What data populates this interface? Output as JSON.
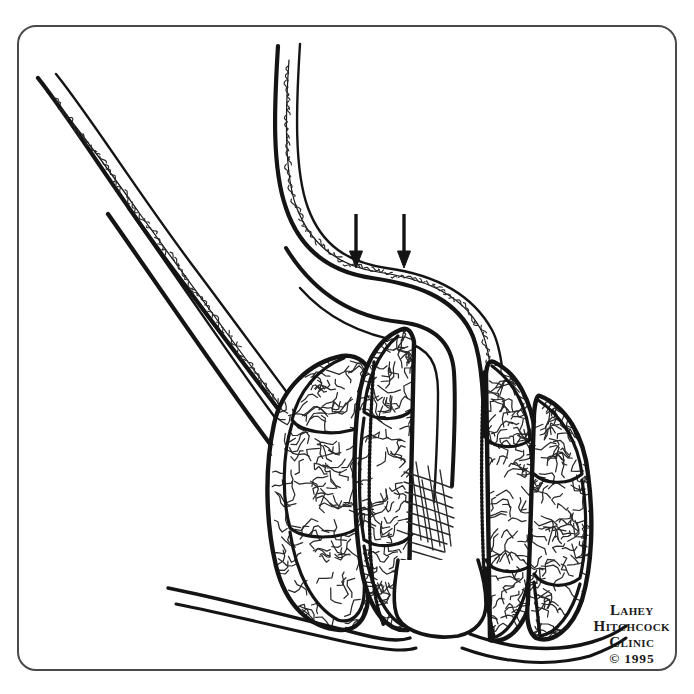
{
  "figure": {
    "kind": "medical-line-illustration",
    "view": "cross-sectional line drawing, black ink on white",
    "canvas": {
      "width": 694,
      "height": 694,
      "background": "#ffffff"
    },
    "ink_color": "#141414",
    "texture_color": "#2a2a2a"
  },
  "frame": {
    "name": "illustration-border",
    "x": 18,
    "y": 26,
    "width": 658,
    "height": 644,
    "radius": 18,
    "stroke": "#4a4a4a",
    "stroke_width": 2
  },
  "annotations": {
    "arrows": [
      {
        "label": "pressure-arrow-left",
        "x": 356,
        "y_start": 214,
        "y_end": 268,
        "head_width": 13,
        "head_length": 17,
        "shaft_width": 3.4
      },
      {
        "label": "pressure-arrow-right",
        "x": 404,
        "y_start": 214,
        "y_end": 268,
        "head_width": 13,
        "head_length": 17,
        "shaft_width": 3.4
      }
    ]
  },
  "anatomy": {
    "upper_left_tube": {
      "name": "sigmoid-limb-outer-wall",
      "outer": "M38,78 C70,118 118,196 172,268 C214,324 262,388 300,438",
      "inner": "M56,74 C90,116 140,196 196,270 C238,326 286,392 324,442",
      "mucosa": "M47,92 C74,122 106,166 140,214 C176,264 214,316 248,362 C272,394 296,428 312,450"
    },
    "lower_left_tube": {
      "name": "rectal-limb-lower-wall",
      "outer": "M108,214 C146,268 196,342 248,414 C280,458 316,506 344,544",
      "inner": "M128,208 C166,262 216,336 268,408 C300,452 336,500 364,538"
    },
    "descending_tube": {
      "name": "rectal-ampulla-anterior-wall",
      "outer": "M278,46 C274,110 272,168 286,208 C300,250 330,272 372,278 C414,284 452,296 470,330 C482,352 484,396 484,436",
      "inner": "M300,44 C296,108 294,170 308,208 C322,246 348,262 386,268 C430,274 470,290 492,330 C504,352 506,400 506,440",
      "mucosa": "M289,60 C285,116 284,172 296,206 C310,244 338,266 378,272 C420,278 460,292 480,328 C492,350 494,398 494,438"
    },
    "posterior_wall": {
      "name": "anal-canal-posterior-wall",
      "outer": "M286,248 C318,300 362,318 400,322 C436,326 452,344 454,372 C456,404 454,448 452,486",
      "inner": "M300,288 C330,322 368,336 404,342 C430,348 438,364 438,392 C438,424 436,466 434,502"
    },
    "lobes_left_outer": {
      "name": "external-hemorrhoidal-lobe-column-left",
      "outline": "M342,356 C310,362 282,388 274,424 C264,470 266,524 276,566 C286,606 310,628 340,630 C356,631 366,620 368,600 L372,380 C370,364 358,354 342,356 Z",
      "segments": [
        "M344,358 C318,368 298,392 292,420 C300,432 330,436 352,430 C364,426 370,414 370,398",
        "M292,424 C282,456 282,498 290,528 C304,540 340,540 358,528 C366,518 368,496 368,470",
        "M290,532 C296,572 312,606 338,620 C352,624 362,614 364,596 L366,540"
      ]
    },
    "lobes_left_inner": {
      "name": "internal-hemorrhoidal-lobe-column-left",
      "outline": "M400,330 C376,340 362,368 358,404 C352,458 354,526 362,572 C370,612 388,632 408,630 L414,342 C412,332 408,326 400,330 Z",
      "segments": [
        "M398,336 C378,352 366,382 364,412 C378,422 402,420 412,410",
        "M364,418 C358,460 358,506 364,540 C380,550 404,546 412,534",
        "M364,546 C370,586 386,618 404,626 L410,552"
      ]
    },
    "lobes_right_inner": {
      "name": "internal-hemorrhoidal-lobe-column-right",
      "outline": "M494,362 C516,372 532,400 536,438 C542,492 540,556 532,596 C524,630 506,644 490,640 L486,374 C487,364 489,360 494,362 Z",
      "segments": [
        "M492,366 C514,382 528,408 530,440 C516,450 494,448 486,438",
        "M530,446 C536,488 536,534 530,566 C514,576 492,572 486,560",
        "M530,572 C524,608 510,634 492,638 L486,568"
      ]
    },
    "lobes_right_outer": {
      "name": "external-hemorrhoidal-lobe-column-right",
      "outline": "M540,396 C566,406 584,436 588,474 C594,520 592,566 582,600 C572,630 552,644 536,638 C528,632 526,618 528,600 L534,414 C535,402 537,394 540,396 Z",
      "segments": [
        "M538,400 C562,416 578,442 582,474 C568,486 544,484 534,474",
        "M582,480 C588,514 586,552 580,578 C564,590 542,586 534,574",
        "M580,584 C572,614 556,634 540,636 L534,582"
      ]
    },
    "dentate_line_left": {
      "name": "dentate-line-left",
      "path": "M374,362 C370,420 368,486 370,540 C371,578 376,608 384,626"
    },
    "dentate_line_right": {
      "name": "dentate-line-right",
      "path": "M484,372 C481,430 481,494 483,548 C484,586 488,616 494,636"
    },
    "sphincter_hatching": {
      "name": "internal-sphincter-hatching",
      "region": {
        "x": 404,
        "y": 462,
        "width": 54,
        "height": 96
      },
      "stroke_count": 15,
      "strokes": [
        "M404,472 C418,476 436,482 452,488",
        "M404,482 C418,486 436,492 452,498",
        "M405,492 C419,496 437,502 453,508",
        "M406,502 C420,506 438,512 454,518",
        "M407,512 C421,516 438,521 453,527",
        "M407,522 C420,526 436,530 450,535",
        "M408,532 C420,536 434,540 447,544",
        "M410,542 C421,545 433,549 444,552",
        "M412,551 C422,554 433,557 442,560",
        "M416,462 C420,486 424,514 428,542",
        "M428,466 C432,490 436,518 440,546",
        "M440,470 C444,494 448,520 451,546",
        "M412,470 C415,492 418,516 421,540",
        "M422,480 C426,504 430,528 433,550",
        "M434,486 C438,508 442,530 445,552"
      ]
    },
    "anal_verge": {
      "name": "anal-verge-base",
      "path": "M398,560 C394,586 392,606 398,618 C406,632 432,640 458,636 C476,632 486,620 486,604 C486,588 482,572 478,560"
    },
    "perianal_skin_left": {
      "name": "perianal-skin-fold-left",
      "lines": [
        "M168,588 C228,600 296,618 352,632 C382,640 398,642 410,638",
        "M176,604 C236,616 300,632 356,644 C386,650 404,652 416,648"
      ]
    },
    "perianal_skin_right": {
      "name": "perianal-skin-fold-right",
      "lines": [
        "M470,634 C508,648 552,654 592,642 C606,638 618,632 626,626",
        "M462,648 C500,662 548,668 590,656 C606,650 618,644 626,638"
      ]
    },
    "mucosal_texture": {
      "name": "mucosal-squiggle-texture",
      "description": "fine gyrus-like squiggles filling each hemorrhoidal lobe",
      "squiggle_density": "high"
    }
  },
  "credit": {
    "name": "publisher-credit",
    "line1": "Lahey",
    "line2": "Hitchcock",
    "line3": "Clinic",
    "year": "© 1995"
  }
}
